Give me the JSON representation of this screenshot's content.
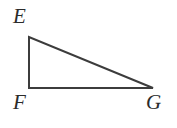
{
  "figure": {
    "kind": "geometry-diagram",
    "shape_name": "right-triangle",
    "background_color": "#ffffff",
    "stroke_color": "#3c3c3c",
    "stroke_width": 2,
    "label_color": "#2b2b2b",
    "canvas": {
      "width": 177,
      "height": 128
    },
    "vertices": [
      {
        "id": "E",
        "label": "E",
        "x": 29,
        "y": 37,
        "label_x": 13,
        "label_y": 6
      },
      {
        "id": "F",
        "label": "F",
        "x": 29,
        "y": 88,
        "label_x": 13,
        "label_y": 92
      },
      {
        "id": "G",
        "label": "G",
        "x": 153,
        "y": 88,
        "label_x": 146,
        "label_y": 92
      }
    ],
    "edges": [
      {
        "id": "EF",
        "from": "E",
        "to": "F"
      },
      {
        "id": "FG",
        "from": "F",
        "to": "G"
      },
      {
        "id": "GE",
        "from": "G",
        "to": "E"
      }
    ],
    "polygon_points": "29,37 29,88 153,88"
  }
}
